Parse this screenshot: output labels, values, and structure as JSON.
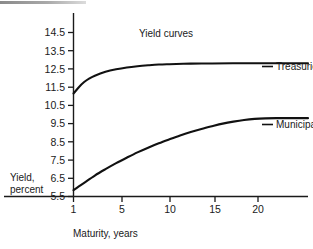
{
  "figure": {
    "title": "Yield curves",
    "artifact_name": "scan-edge-bar"
  },
  "chart_data": {
    "type": "line",
    "title": "Yield curves",
    "xlabel": "Maturity, years",
    "ylabel": "Yield, percent",
    "ylabel_line1": "Yield,",
    "ylabel_line2": "percent",
    "xlim": [
      1,
      23
    ],
    "ylim": [
      5.5,
      15.0
    ],
    "xticks": [
      1,
      5,
      10,
      15,
      20
    ],
    "xtick_labels": [
      "1",
      "5",
      "10",
      "15",
      "20"
    ],
    "yticks": [
      5.5,
      6.5,
      7.5,
      8.5,
      9.5,
      10.5,
      11.5,
      12.5,
      13.5,
      14.5
    ],
    "ytick_labels": [
      "5.5",
      "6.5",
      "7.5",
      "8.5",
      "9.5",
      "10.5",
      "11.5",
      "12.5",
      "13.5",
      "14.5"
    ],
    "grid": false,
    "legend_position": "right-of-curve-ends",
    "series": [
      {
        "name": "Treasuries",
        "label": "Treasuries",
        "color": "#111111",
        "x": [
          1,
          1.5,
          2,
          2.5,
          3,
          4,
          5,
          6,
          7,
          8,
          9,
          10,
          12,
          14,
          16,
          18,
          20,
          22,
          23
        ],
        "values": [
          11.15,
          11.5,
          11.78,
          11.98,
          12.13,
          12.34,
          12.48,
          12.58,
          12.65,
          12.7,
          12.74,
          12.76,
          12.79,
          12.8,
          12.81,
          12.81,
          12.81,
          12.81,
          12.81
        ]
      },
      {
        "name": "Municipals",
        "label": "Municipals",
        "color": "#111111",
        "x": [
          1,
          1.5,
          2,
          3,
          4,
          5,
          6,
          7,
          8,
          9,
          10,
          11,
          12,
          13,
          14,
          15,
          16,
          17,
          18,
          19,
          20,
          21,
          22,
          23
        ],
        "values": [
          5.85,
          6.05,
          6.25,
          6.65,
          7.0,
          7.33,
          7.63,
          7.92,
          8.18,
          8.42,
          8.64,
          8.85,
          9.04,
          9.21,
          9.36,
          9.5,
          9.61,
          9.7,
          9.76,
          9.79,
          9.8,
          9.8,
          9.8,
          9.8
        ]
      }
    ]
  }
}
